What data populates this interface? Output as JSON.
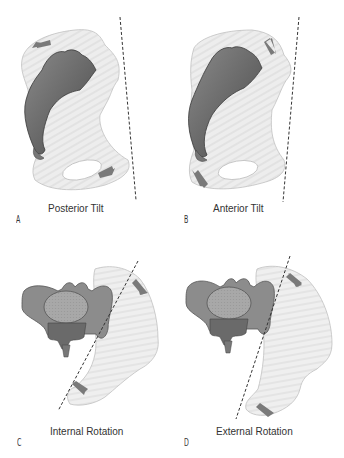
{
  "figure": {
    "panels": [
      {
        "letter": "A",
        "caption": "Posterior Tilt",
        "view": "lateral",
        "movement": "posterior-tilt"
      },
      {
        "letter": "B",
        "caption": "Anterior Tilt",
        "view": "lateral",
        "movement": "anterior-tilt"
      },
      {
        "letter": "C",
        "caption": "Internal Rotation",
        "view": "superior",
        "movement": "internal-rotation"
      },
      {
        "letter": "D",
        "caption": "External Rotation",
        "view": "superior",
        "movement": "external-rotation"
      }
    ],
    "colors": {
      "background": "#ffffff",
      "ilium_fill": "#ececec",
      "ilium_stroke": "#b8b8b8",
      "sacrum_fill": "#6e6e6e",
      "sacrum_dark": "#4a4a4a",
      "vertebra_fill": "#8c8c8c",
      "arrow_fill": "#7a7a7a",
      "dashed_line": "#333333",
      "text": "#333333"
    }
  }
}
